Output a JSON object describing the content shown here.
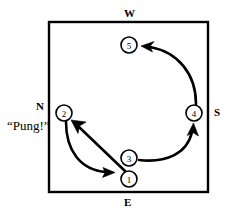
{
  "figure": {
    "background": "#ffffff",
    "ink": "#000000",
    "board": {
      "x": 48,
      "y": 21,
      "width": 161,
      "height": 172,
      "stroke": "#000000",
      "stroke_width": 2
    },
    "direction_labels": [
      {
        "name": "north",
        "text": "N",
        "x": 36,
        "y": 101
      },
      {
        "name": "south",
        "text": "S",
        "x": 214,
        "y": 107
      },
      {
        "name": "east",
        "text": "E",
        "x": 124,
        "y": 197
      },
      {
        "name": "west",
        "text": "W",
        "x": 124,
        "y": 8
      }
    ],
    "callouts": [
      {
        "name": "pung-callout",
        "text": "“Pung!”",
        "x": 7,
        "y": 119
      }
    ],
    "nodes": [
      {
        "id": "1",
        "label": "1",
        "cx": 129,
        "cy": 179,
        "r": 8
      },
      {
        "id": "2",
        "label": "2",
        "cx": 64,
        "cy": 113,
        "r": 8
      },
      {
        "id": "3",
        "label": "3",
        "cx": 129,
        "cy": 158,
        "r": 8
      },
      {
        "id": "4",
        "label": "4",
        "cx": 194,
        "cy": 113,
        "r": 8
      },
      {
        "id": "5",
        "label": "5",
        "cx": 129,
        "cy": 45,
        "r": 8
      }
    ],
    "arrows": [
      {
        "name": "arrow-1-to-2",
        "from": "1",
        "to": "2",
        "style": "straight"
      },
      {
        "name": "arrow-2-to-1",
        "from": "2",
        "to": "1",
        "style": "curved"
      },
      {
        "name": "arrow-3-to-4",
        "from": "3",
        "to": "4",
        "style": "curved"
      },
      {
        "name": "arrow-4-to-5",
        "from": "4",
        "to": "5",
        "style": "curved"
      }
    ]
  }
}
